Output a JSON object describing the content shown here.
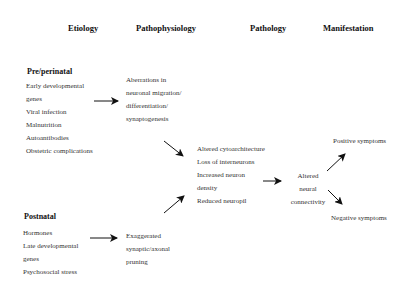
{
  "headers": {
    "etiology": "Etiology",
    "pathophysiology": "Pathophysiology",
    "pathology": "Pathology",
    "manifestation": "Manifestation"
  },
  "prenatal": {
    "title": "Pre/perinatal",
    "items": [
      "Early developmental",
      "genes",
      "Viral infection",
      "Malnutrition",
      "Autoantibodies",
      "Obstetric complications"
    ]
  },
  "postnatal": {
    "title": "Postnatal",
    "items": [
      "Hormones",
      "Late developmental",
      "genes",
      "Psychosocial stress"
    ]
  },
  "pathophys_prenatal": {
    "lines": [
      "Aberrations in",
      "neuronal migration/",
      "differentiation/",
      "synaptogenesis"
    ]
  },
  "pathophys_postnatal": {
    "lines": [
      "Exaggerated",
      "synaptic/axonal",
      "pruning"
    ]
  },
  "pathology_block": {
    "lines": [
      "Altered cytoarchitecture",
      "Loss of interneurons",
      "Increased neuron",
      "density",
      "Reduced neuropil"
    ]
  },
  "connectivity": {
    "lines": [
      "Altered",
      "neural",
      "connectivity"
    ]
  },
  "manifestation": {
    "positive": "Positive symptoms",
    "negative": "Negative symptoms"
  }
}
